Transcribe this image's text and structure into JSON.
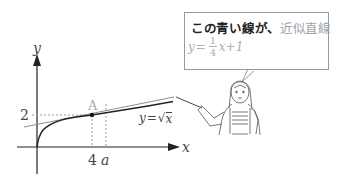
{
  "diagram": {
    "type": "math-illustration",
    "axes": {
      "x_label": "x",
      "y_label": "y"
    },
    "ticks": {
      "x_tick_4": "4",
      "x_tick_a": "a",
      "y_tick_2": "2"
    },
    "point": {
      "label": "A",
      "coords": [
        4,
        2
      ]
    },
    "curve_label": "y=√x",
    "curve_label_parts": {
      "lhs": "y",
      "eq": "=",
      "sqrt": "√",
      "arg": "x"
    },
    "tangent_line": {
      "equation": "y = 1/4 x + 1",
      "color": "#8f8f8f"
    },
    "colors": {
      "curve": "#222222",
      "axes": "#222222",
      "dashed": "#9a9a9a",
      "point_label": "#a8a8a8",
      "highlight": "#9aa3ad"
    }
  },
  "speech_bubble": {
    "line1_main": "この青い線が、",
    "line1_highlight": "近似直線",
    "eq_lhs": "y",
    "eq_equals": "=",
    "frac_num": "1",
    "frac_den": "4",
    "eq_rest": "x+1"
  },
  "character": {
    "description": "teacher holding a pointer"
  }
}
